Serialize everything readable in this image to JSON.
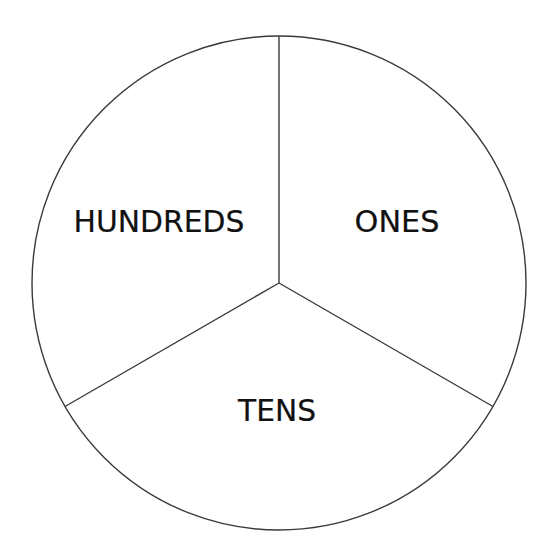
{
  "diagram": {
    "type": "place-value-circle",
    "circle": {
      "cx": 279,
      "cy": 283,
      "r": 247
    },
    "stroke_color": "#3a3a3a",
    "text_color": "#111111",
    "sections": [
      {
        "label": "ONES",
        "position": "upper-right",
        "text_x": 397,
        "text_y": 232,
        "text_width": 85
      },
      {
        "label": "TENS",
        "position": "bottom",
        "text_x": 277,
        "text_y": 421,
        "text_width": 78
      },
      {
        "label": "HUNDREDS",
        "position": "upper-left",
        "text_x": 159,
        "text_y": 232,
        "text_width": 171
      }
    ],
    "dividers": [
      {
        "name": "top",
        "x2": 279,
        "y2": 36
      },
      {
        "name": "lower-left",
        "x2": 65,
        "y2": 406.5
      },
      {
        "name": "lower-right",
        "x2": 493,
        "y2": 406.5
      }
    ]
  }
}
